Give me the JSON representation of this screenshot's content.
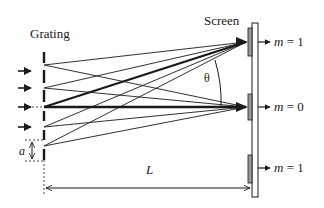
{
  "diagram": {
    "labels": {
      "grating": "Grating",
      "screen": "Screen",
      "theta": "θ",
      "slit_spacing": "a",
      "distance": "L"
    },
    "orders": [
      {
        "m_symbol": "m",
        "eq": " = 1",
        "position": "top"
      },
      {
        "m_symbol": "m",
        "eq": " = 0",
        "position": "center"
      },
      {
        "m_symbol": "m",
        "eq": " = 1",
        "position": "bottom"
      }
    ],
    "incident_arrows": 5,
    "colors": {
      "line": "#1a1a1a",
      "screen_fill": "#ffffff",
      "spot_fill": "#9a9a9a"
    }
  }
}
